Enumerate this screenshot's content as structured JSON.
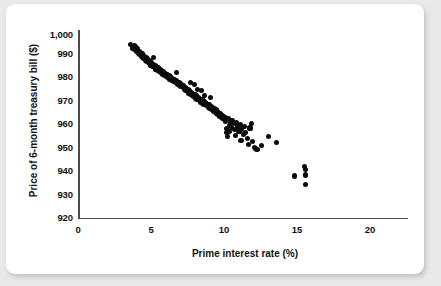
{
  "figure": {
    "background_color": "#e9e9e9",
    "card_color": "#ffffff",
    "point_color": "#0b0b0b",
    "axis_color": "#4b4b4b"
  },
  "axes": {
    "x_title": "Prime interest rate (%)",
    "y_title": "Price of 6-month treasury bill ($)",
    "x_ticks": [
      "0",
      "5",
      "10",
      "15",
      "20"
    ],
    "y_ticks": [
      "1,000",
      "990",
      "980",
      "970",
      "960",
      "950",
      "940",
      "930",
      "920"
    ]
  },
  "chart_data": {
    "type": "scatter",
    "title": "",
    "xlabel": "Prime interest rate (%)",
    "ylabel": "Price of 6-month treasury bill ($)",
    "xlim": [
      0,
      22.7
    ],
    "ylim": [
      920,
      1002
    ],
    "xticks": [
      0,
      5,
      10,
      15,
      20
    ],
    "yticks": [
      920,
      930,
      940,
      950,
      960,
      970,
      980,
      990,
      1000
    ],
    "grid": false,
    "legend": "none",
    "marker": "filled-circle",
    "series": [
      {
        "name": "Treasury bill price vs prime rate",
        "points": [
          [
            3.75,
            995.0
          ],
          [
            3.85,
            994.2
          ],
          [
            3.9,
            993.4
          ],
          [
            4.0,
            994.6
          ],
          [
            4.05,
            992.8
          ],
          [
            4.1,
            993.9
          ],
          [
            4.15,
            991.9
          ],
          [
            4.2,
            992.5
          ],
          [
            4.25,
            993.2
          ],
          [
            4.3,
            991.2
          ],
          [
            4.35,
            992.1
          ],
          [
            4.4,
            990.6
          ],
          [
            4.45,
            991.6
          ],
          [
            4.5,
            990.0
          ],
          [
            4.55,
            991.0
          ],
          [
            4.6,
            989.4
          ],
          [
            4.65,
            990.4
          ],
          [
            4.7,
            988.9
          ],
          [
            4.75,
            989.9
          ],
          [
            4.8,
            988.3
          ],
          [
            4.85,
            989.2
          ],
          [
            4.9,
            987.8
          ],
          [
            4.95,
            988.7
          ],
          [
            5.0,
            987.2
          ],
          [
            5.05,
            988.1
          ],
          [
            5.1,
            986.7
          ],
          [
            5.15,
            987.6
          ],
          [
            5.2,
            986.1
          ],
          [
            5.25,
            987.0
          ],
          [
            5.3,
            985.6
          ],
          [
            5.35,
            989.4
          ],
          [
            5.4,
            986.4
          ],
          [
            5.45,
            985.0
          ],
          [
            5.5,
            985.9
          ],
          [
            5.55,
            984.4
          ],
          [
            5.6,
            985.3
          ],
          [
            5.65,
            983.9
          ],
          [
            5.7,
            984.8
          ],
          [
            5.8,
            983.3
          ],
          [
            5.85,
            984.2
          ],
          [
            5.9,
            982.8
          ],
          [
            5.95,
            983.7
          ],
          [
            6.0,
            982.2
          ],
          [
            6.1,
            983.1
          ],
          [
            6.15,
            981.7
          ],
          [
            6.2,
            982.6
          ],
          [
            6.3,
            981.1
          ],
          [
            6.35,
            982.0
          ],
          [
            6.4,
            980.6
          ],
          [
            6.5,
            981.5
          ],
          [
            6.55,
            980.0
          ],
          [
            6.6,
            980.9
          ],
          [
            6.7,
            979.5
          ],
          [
            6.75,
            980.4
          ],
          [
            6.8,
            978.9
          ],
          [
            6.9,
            979.8
          ],
          [
            6.95,
            978.4
          ],
          [
            7.0,
            979.3
          ],
          [
            7.05,
            983.0
          ],
          [
            7.1,
            977.8
          ],
          [
            7.2,
            978.7
          ],
          [
            7.25,
            977.3
          ],
          [
            7.3,
            978.2
          ],
          [
            7.35,
            976.7
          ],
          [
            7.4,
            977.6
          ],
          [
            7.5,
            976.2
          ],
          [
            7.55,
            977.1
          ],
          [
            7.6,
            975.6
          ],
          [
            7.65,
            976.5
          ],
          [
            7.7,
            975.1
          ],
          [
            7.75,
            976.0
          ],
          [
            7.8,
            974.5
          ],
          [
            7.85,
            975.4
          ],
          [
            7.9,
            973.9
          ],
          [
            7.95,
            974.9
          ],
          [
            8.0,
            973.4
          ],
          [
            8.05,
            978.5
          ],
          [
            8.1,
            974.3
          ],
          [
            8.15,
            972.8
          ],
          [
            8.2,
            973.8
          ],
          [
            8.25,
            972.3
          ],
          [
            8.3,
            977.8
          ],
          [
            8.35,
            973.2
          ],
          [
            8.4,
            971.7
          ],
          [
            8.45,
            972.7
          ],
          [
            8.5,
            971.2
          ],
          [
            8.55,
            975.5
          ],
          [
            8.6,
            972.1
          ],
          [
            8.65,
            970.6
          ],
          [
            8.7,
            971.6
          ],
          [
            8.75,
            970.1
          ],
          [
            8.8,
            974.9
          ],
          [
            8.85,
            971.0
          ],
          [
            8.9,
            969.5
          ],
          [
            8.95,
            970.5
          ],
          [
            9.0,
            969.0
          ],
          [
            9.05,
            973.0
          ],
          [
            9.1,
            969.9
          ],
          [
            9.15,
            968.4
          ],
          [
            9.2,
            969.4
          ],
          [
            9.3,
            967.9
          ],
          [
            9.35,
            968.8
          ],
          [
            9.4,
            967.3
          ],
          [
            9.45,
            972.0
          ],
          [
            9.5,
            968.3
          ],
          [
            9.55,
            966.8
          ],
          [
            9.6,
            967.7
          ],
          [
            9.7,
            966.2
          ],
          [
            9.75,
            967.2
          ],
          [
            9.8,
            965.7
          ],
          [
            9.85,
            966.6
          ],
          [
            9.9,
            965.1
          ],
          [
            9.95,
            966.1
          ],
          [
            10.0,
            964.6
          ],
          [
            10.05,
            965.5
          ],
          [
            10.1,
            964.0
          ],
          [
            10.2,
            965.0
          ],
          [
            10.25,
            963.5
          ],
          [
            10.3,
            964.4
          ],
          [
            10.35,
            962.9
          ],
          [
            10.4,
            963.9
          ],
          [
            10.45,
            962.4
          ],
          [
            10.5,
            963.3
          ],
          [
            10.55,
            961.8
          ],
          [
            10.6,
            958.5
          ],
          [
            10.65,
            956.8
          ],
          [
            10.7,
            955.2
          ],
          [
            10.75,
            962.8
          ],
          [
            10.8,
            960.0
          ],
          [
            10.85,
            957.2
          ],
          [
            10.9,
            961.3
          ],
          [
            10.95,
            959.0
          ],
          [
            11.0,
            962.2
          ],
          [
            11.1,
            960.6
          ],
          [
            11.2,
            958.0
          ],
          [
            11.25,
            955.6
          ],
          [
            11.3,
            961.0
          ],
          [
            11.4,
            959.4
          ],
          [
            11.5,
            957.5
          ],
          [
            11.6,
            960.2
          ],
          [
            11.65,
            953.5
          ],
          [
            11.7,
            958.4
          ],
          [
            11.8,
            956.0
          ],
          [
            11.9,
            959.6
          ],
          [
            12.0,
            957.0
          ],
          [
            12.1,
            954.2
          ],
          [
            12.2,
            951.5
          ],
          [
            12.3,
            958.8
          ],
          [
            12.4,
            960.6
          ],
          [
            12.5,
            953.0
          ],
          [
            12.6,
            950.4
          ],
          [
            12.7,
            950.0
          ],
          [
            12.8,
            949.4
          ],
          [
            13.1,
            951.2
          ],
          [
            13.6,
            955.0
          ],
          [
            14.2,
            952.6
          ],
          [
            15.5,
            938.0
          ],
          [
            16.2,
            942.0
          ],
          [
            16.3,
            940.8
          ],
          [
            16.25,
            938.4
          ],
          [
            16.3,
            934.3
          ]
        ]
      }
    ]
  }
}
